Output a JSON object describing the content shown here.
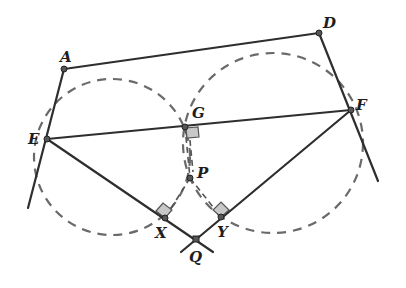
{
  "diagram": {
    "type": "geometry",
    "colors": {
      "solid_line": "#2e2e2e",
      "dashed": "#6a6a6a",
      "right_angle_fill": "#c8c8c8",
      "background": "#ffffff"
    },
    "points": [
      {
        "name": "A",
        "label": "A",
        "x": 64,
        "y": 69
      },
      {
        "name": "D",
        "label": "D",
        "x": 319,
        "y": 33
      },
      {
        "name": "E",
        "label": "E",
        "x": 47,
        "y": 139
      },
      {
        "name": "F",
        "label": "F",
        "x": 351,
        "y": 110
      },
      {
        "name": "G",
        "label": "G",
        "x": 185,
        "y": 127
      },
      {
        "name": "P",
        "label": "P",
        "x": 190,
        "y": 178
      },
      {
        "name": "X",
        "label": "X",
        "x": 165,
        "y": 218
      },
      {
        "name": "Y",
        "label": "Y",
        "x": 221,
        "y": 217
      },
      {
        "name": "Q",
        "label": "Q",
        "x": 196,
        "y": 239
      }
    ],
    "segments_solid": [
      "AD",
      "AE (extended)",
      "DF (extended)",
      "EF",
      "EQ (through X)",
      "FQ (through Y)"
    ],
    "segments_dashed": [
      "GP",
      "PX",
      "PY"
    ],
    "circles_dashed": [
      {
        "name": "left-circle",
        "through": [
          "E",
          "G",
          "X"
        ],
        "cx": 112,
        "cy": 157,
        "r": 78
      },
      {
        "name": "right-circle",
        "through": [
          "F",
          "G",
          "Y"
        ],
        "cx": 273,
        "cy": 143,
        "r": 90
      }
    ],
    "right_angles": [
      "G",
      "X",
      "Y"
    ]
  },
  "labels": {
    "A": "A",
    "D": "D",
    "E": "E",
    "F": "F",
    "G": "G",
    "P": "P",
    "X": "X",
    "Y": "Y",
    "Q": "Q"
  }
}
